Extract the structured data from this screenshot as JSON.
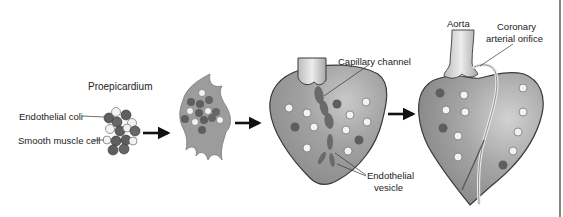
{
  "figure": {
    "stages": [
      {
        "id": "proepicardium",
        "label": "Proepicardium"
      },
      {
        "id": "migrating-cluster",
        "label": ""
      },
      {
        "id": "early-heart",
        "label": ""
      },
      {
        "id": "mature-heart",
        "label": ""
      }
    ],
    "labels": {
      "proepicardium": "Proepicardium",
      "endothelial_cell": "Endothelial coli",
      "smooth_muscle_cell": "Smooth muscle cell",
      "capillary_channel": "Capillary channel",
      "endothelial_vesicle_line1": "Endothelial",
      "endothelial_vesicle_line2": "vesicle",
      "aorta": "Aorta",
      "coronary_orifice_line1": "Coronary",
      "coronary_orifice_line2": "arterial orifice"
    },
    "colors": {
      "tissue": "#9a9a9a",
      "tissue_dark": "#7e7e7e",
      "outline": "#3a3a3a",
      "dark_cell": "#5e5e5e",
      "light_cell": "#f2f2f2",
      "arrow": "#111111",
      "border": "#333333"
    }
  }
}
